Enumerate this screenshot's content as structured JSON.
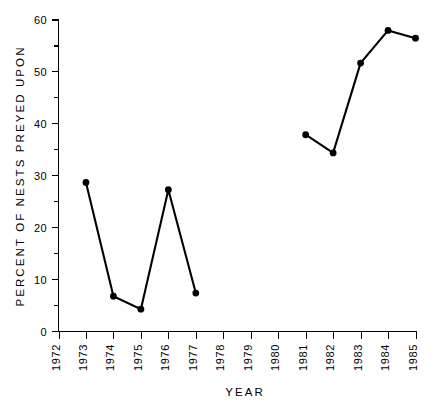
{
  "chart_data": {
    "type": "line",
    "title": "",
    "xlabel": "YEAR",
    "ylabel": "PERCENT OF NESTS PREYED UPON",
    "x": [
      1973,
      1974,
      1975,
      1976,
      1977,
      1981,
      1982,
      1983,
      1984,
      1985
    ],
    "values": [
      28.7,
      6.8,
      4.3,
      27.3,
      7.4,
      37.9,
      34.4,
      51.7,
      58.0,
      56.5
    ],
    "series": [
      {
        "name": "Percent of nests preyed upon",
        "segments": [
          {
            "x": [
              1973,
              1974,
              1975,
              1976,
              1977
            ],
            "values": [
              28.7,
              6.8,
              4.3,
              27.3,
              7.4
            ]
          },
          {
            "x": [
              1981,
              1982,
              1983,
              1984,
              1985
            ],
            "values": [
              37.9,
              34.4,
              51.7,
              58.0,
              56.5
            ]
          }
        ]
      }
    ],
    "xlim": [
      1972,
      1985
    ],
    "ylim": [
      0,
      60
    ],
    "xticks": [
      1972,
      1973,
      1974,
      1975,
      1976,
      1977,
      1978,
      1979,
      1980,
      1981,
      1982,
      1983,
      1984,
      1985
    ],
    "xtick_labels": [
      "1972",
      "1973",
      "1974",
      "1975",
      "1976",
      "1977",
      "1978",
      "1979",
      "1980",
      "1981",
      "1982",
      "1983",
      "1984",
      "1985"
    ],
    "yticks_major": [
      0,
      10,
      20,
      30,
      40,
      50,
      60
    ],
    "ytick_labels": [
      "0",
      "10",
      "20",
      "30",
      "40",
      "50",
      "60"
    ],
    "yticks_minor": [
      5,
      15,
      25,
      35,
      45,
      55
    ],
    "grid": false,
    "legend": false,
    "marker": "filled-circle",
    "line_color": "#000000",
    "marker_color": "#000000",
    "background_color": "#ffffff"
  }
}
